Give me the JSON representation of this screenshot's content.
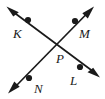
{
  "figure": {
    "background_color": "#ffffff",
    "stroke_color": "#1a1a1a",
    "label_color": "#1a1a1a",
    "width": 105,
    "height": 99,
    "labels": {
      "k": "K",
      "m": "M",
      "n": "N",
      "l": "L",
      "p": "P"
    },
    "points": [
      {
        "name": "K",
        "label": "K",
        "x": 28,
        "y": 20,
        "label_x": 13,
        "label_y": 38
      },
      {
        "name": "M",
        "label": "M",
        "x": 75,
        "y": 21,
        "label_x": 79,
        "label_y": 38
      },
      {
        "name": "P",
        "label": "P",
        "x": 55,
        "y": 45,
        "label_x": 56,
        "label_y": 63
      },
      {
        "name": "L",
        "label": "L",
        "x": 80,
        "y": 67,
        "label_x": 70,
        "label_y": 85
      },
      {
        "name": "N",
        "label": "N",
        "x": 29,
        "y": 78,
        "label_x": 34,
        "label_y": 93
      }
    ],
    "lines": [
      {
        "name": "line-KL",
        "through": [
          "K",
          "P",
          "L"
        ],
        "arrow_start": {
          "x": 8,
          "y": 8
        },
        "arrow_end": {
          "x": 98,
          "y": 75
        },
        "double_arrow": true
      },
      {
        "name": "line-NM",
        "through": [
          "N",
          "P",
          "M"
        ],
        "arrow_start": {
          "x": 10,
          "y": 92
        },
        "arrow_end": {
          "x": 92,
          "y": 8
        },
        "double_arrow": true
      }
    ]
  }
}
